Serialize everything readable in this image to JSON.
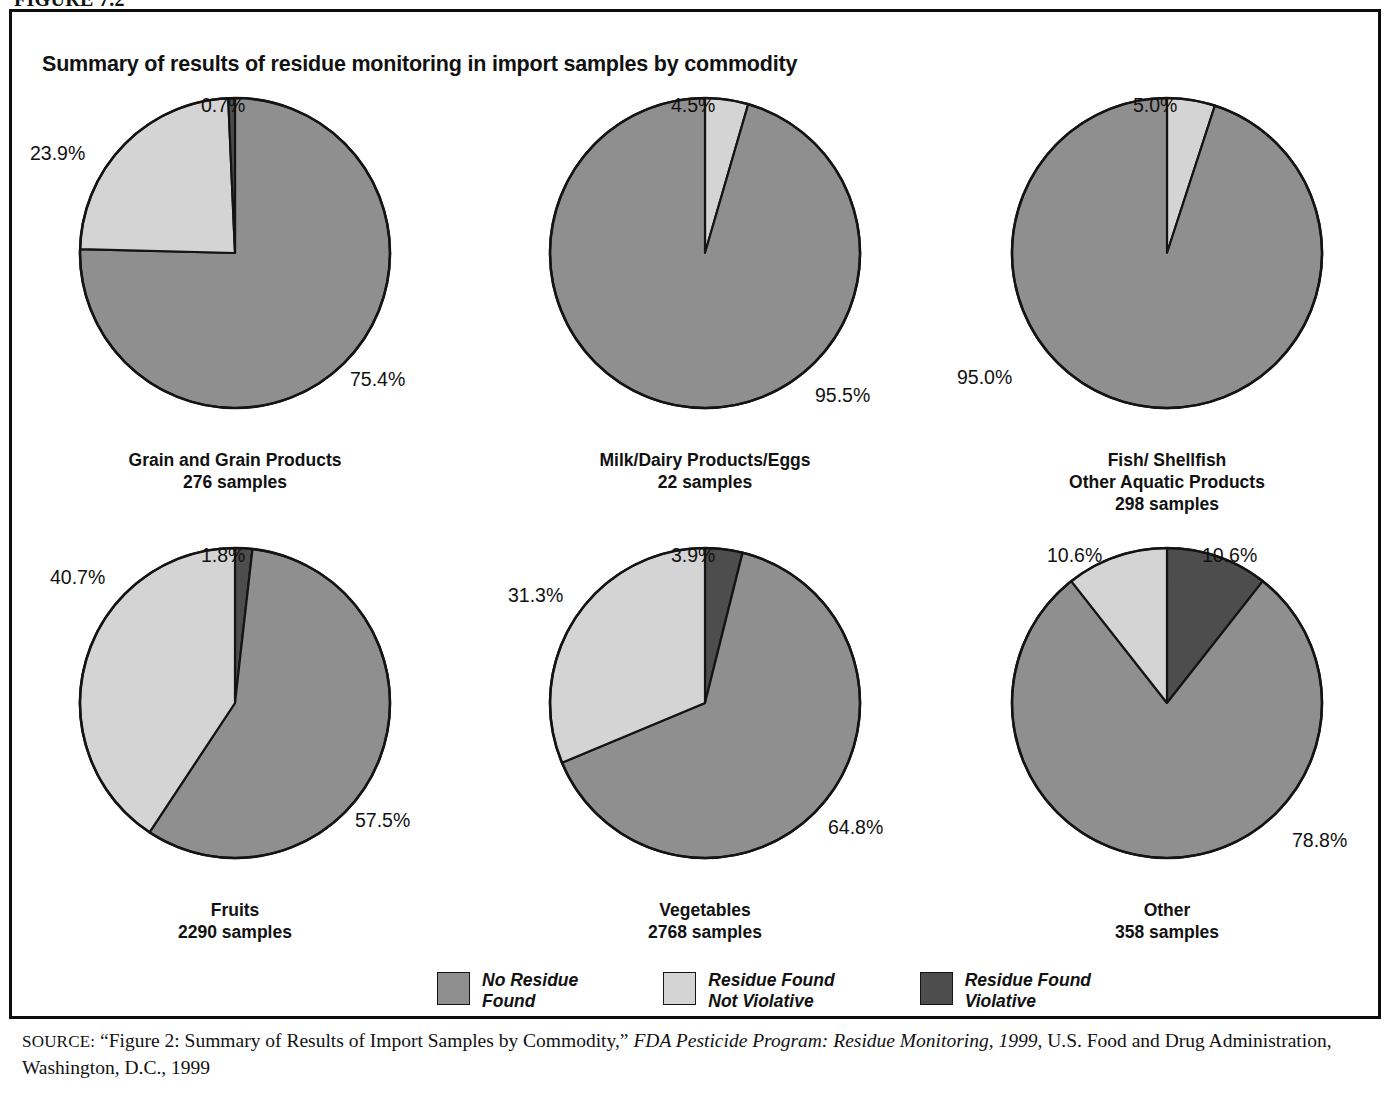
{
  "figure": {
    "number": "FIGURE 7.2",
    "title": "Summary of results of residue monitoring in import samples by commodity"
  },
  "colors": {
    "no_residue": "#8f8f8f",
    "not_violative": "#d4d4d4",
    "violative": "#4d4d4d",
    "outline": "#141414",
    "text": "#111111"
  },
  "legend": {
    "items": [
      {
        "label": "No Residue\nFound",
        "color_key": "no_residue"
      },
      {
        "label": "Residue Found\nNot Violative",
        "color_key": "not_violative"
      },
      {
        "label": "Residue Found\nViolative",
        "color_key": "violative"
      }
    ]
  },
  "source": {
    "label": "SOURCE:",
    "text_1": " “Figure 2: Summary of Results of Import Samples by Commodity,” ",
    "italic_1": "FDA Pesticide Program: Residue Monitoring, 1999",
    "text_2": ", U.S. Food and Drug Administration, Washington, D.C., 1999"
  },
  "chart_data": {
    "type": "pie",
    "title": "Summary of results of residue monitoring in import samples by commodity",
    "legend_position": "bottom",
    "categories": [
      "No Residue Found",
      "Residue Found Not Violative",
      "Residue Found Violative"
    ],
    "charts": [
      {
        "name": "Grain and Grain Products",
        "caption_line1": "Grain and Grain Products",
        "caption_line2": "276 samples",
        "caption_line3": "",
        "samples": 276,
        "values": [
          75.4,
          23.9,
          0.7
        ],
        "labels": [
          "75.4%",
          "23.9%",
          "0.7%"
        ],
        "slices": [
          {
            "name": "No Residue Found",
            "value": 75.4,
            "label": "75.4%",
            "color_key": "no_residue"
          },
          {
            "name": "Residue Found Not Violative",
            "value": 23.9,
            "label": "23.9%",
            "color_key": "not_violative"
          },
          {
            "name": "Residue Found Violative",
            "value": 0.7,
            "label": "0.7%",
            "color_key": "violative"
          }
        ]
      },
      {
        "name": "Milk/Dairy Products/Eggs",
        "caption_line1": "Milk/Dairy Products/Eggs",
        "caption_line2": "22 samples",
        "caption_line3": "",
        "samples": 22,
        "values": [
          95.5,
          4.5,
          0
        ],
        "labels": [
          "95.5%",
          "4.5%",
          ""
        ],
        "slices": [
          {
            "name": "Residue Found Not Violative",
            "value": 4.5,
            "label": "4.5%",
            "color_key": "not_violative"
          },
          {
            "name": "No Residue Found",
            "value": 95.5,
            "label": "95.5%",
            "color_key": "no_residue"
          }
        ]
      },
      {
        "name": "Fish/ Shellfish Other Aquatic Products",
        "caption_line1": "Fish/ Shellfish",
        "caption_line2": "Other Aquatic Products",
        "caption_line3": "298 samples",
        "samples": 298,
        "values": [
          95.0,
          5.0,
          0
        ],
        "labels": [
          "95.0%",
          "5.0%",
          ""
        ],
        "slices": [
          {
            "name": "Residue Found Not Violative",
            "value": 5.0,
            "label": "5.0%",
            "color_key": "not_violative"
          },
          {
            "name": "No Residue Found",
            "value": 95.0,
            "label": "95.0%",
            "color_key": "no_residue"
          }
        ]
      },
      {
        "name": "Fruits",
        "caption_line1": "Fruits",
        "caption_line2": "2290 samples",
        "caption_line3": "",
        "samples": 2290,
        "values": [
          57.5,
          40.7,
          1.8
        ],
        "labels": [
          "57.5%",
          "40.7%",
          "1.8%"
        ],
        "slices": [
          {
            "name": "Residue Found Violative",
            "value": 1.8,
            "label": "1.8%",
            "color_key": "violative"
          },
          {
            "name": "No Residue Found",
            "value": 57.5,
            "label": "57.5%",
            "color_key": "no_residue"
          },
          {
            "name": "Residue Found Not Violative",
            "value": 40.7,
            "label": "40.7%",
            "color_key": "not_violative"
          }
        ]
      },
      {
        "name": "Vegetables",
        "caption_line1": "Vegetables",
        "caption_line2": "2768 samples",
        "caption_line3": "",
        "samples": 2768,
        "values": [
          64.8,
          31.3,
          3.9
        ],
        "labels": [
          "64.8%",
          "31.3%",
          "3.9%"
        ],
        "slices": [
          {
            "name": "Residue Found Violative",
            "value": 3.9,
            "label": "3.9%",
            "color_key": "violative"
          },
          {
            "name": "No Residue Found",
            "value": 64.8,
            "label": "64.8%",
            "color_key": "no_residue"
          },
          {
            "name": "Residue Found Not Violative",
            "value": 31.3,
            "label": "31.3%",
            "color_key": "not_violative"
          }
        ]
      },
      {
        "name": "Other",
        "caption_line1": "Other",
        "caption_line2": "358 samples",
        "caption_line3": "",
        "samples": 358,
        "values": [
          78.8,
          10.6,
          10.6
        ],
        "labels": [
          "78.8%",
          "10.6%",
          "10.6%"
        ],
        "slices": [
          {
            "name": "Residue Found Violative",
            "value": 10.6,
            "label": "10.6%",
            "color_key": "violative"
          },
          {
            "name": "No Residue Found",
            "value": 78.8,
            "label": "78.8%",
            "color_key": "no_residue"
          },
          {
            "name": "Residue Found Not Violative",
            "value": 10.6,
            "label": "10.6%",
            "color_key": "not_violative"
          }
        ]
      }
    ]
  }
}
